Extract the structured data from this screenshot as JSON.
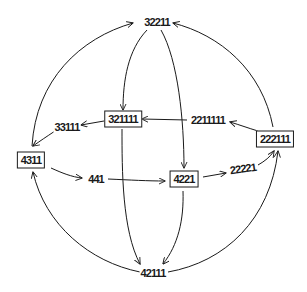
{
  "diagram": {
    "type": "directed-graph",
    "stroke_color": "#1a1a1a",
    "background_color": "#ffffff",
    "nodes": [
      {
        "id": "n32211",
        "label": "32211",
        "boxed": false,
        "x": 157,
        "y": 22
      },
      {
        "id": "n321111",
        "label": "321111",
        "boxed": true,
        "x": 123,
        "y": 119
      },
      {
        "id": "n2211111",
        "label": "2211111",
        "boxed": false,
        "x": 208,
        "y": 120
      },
      {
        "id": "n222111",
        "label": "222111",
        "boxed": true,
        "x": 275,
        "y": 139
      },
      {
        "id": "n33111",
        "label": "33111",
        "boxed": false,
        "x": 67,
        "y": 127
      },
      {
        "id": "n4311",
        "label": "4311",
        "boxed": true,
        "x": 31,
        "y": 160
      },
      {
        "id": "n441",
        "label": "441",
        "boxed": false,
        "x": 96,
        "y": 179
      },
      {
        "id": "n4221",
        "label": "4221",
        "boxed": true,
        "x": 184,
        "y": 179
      },
      {
        "id": "n22221",
        "label": "22221",
        "boxed": false,
        "x": 243,
        "y": 169
      },
      {
        "id": "n42111",
        "label": "42111",
        "boxed": false,
        "x": 153,
        "y": 273
      }
    ],
    "edges": [
      {
        "from": "32211",
        "to": "321111"
      },
      {
        "from": "32211",
        "to": "4221"
      },
      {
        "from": "4311",
        "to": "32211"
      },
      {
        "from": "222111",
        "to": "32211"
      },
      {
        "from": "2211111",
        "to": "321111"
      },
      {
        "from": "222111",
        "to": "2211111"
      },
      {
        "from": "321111",
        "to": "33111"
      },
      {
        "from": "33111",
        "to": "4311"
      },
      {
        "from": "4311",
        "to": "441"
      },
      {
        "from": "441",
        "to": "4221"
      },
      {
        "from": "4221",
        "to": "22221"
      },
      {
        "from": "22221",
        "to": "222111"
      },
      {
        "from": "321111",
        "to": "42111"
      },
      {
        "from": "4221",
        "to": "42111"
      },
      {
        "from": "42111",
        "to": "4311"
      },
      {
        "from": "42111",
        "to": "222111"
      }
    ]
  }
}
